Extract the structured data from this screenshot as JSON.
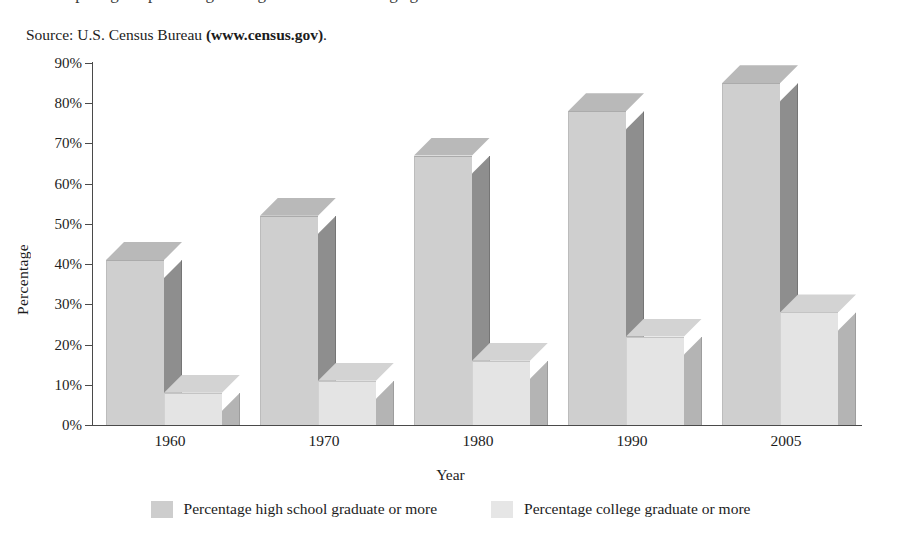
{
  "figure": {
    "headline_clipped": "comparing the percentage of high school and college graduates",
    "source_prefix": "Source: U.S. Census Bureau ",
    "source_site": "(www.census.gov)",
    "source_suffix": "."
  },
  "chart_data": {
    "type": "bar",
    "title": "",
    "xlabel": "Year",
    "ylabel": "Percentage",
    "categories": [
      "1960",
      "1970",
      "1980",
      "1990",
      "2005"
    ],
    "ytick_labels": [
      "0%",
      "10%",
      "20%",
      "30%",
      "40%",
      "50%",
      "60%",
      "70%",
      "80%",
      "90%"
    ],
    "ytick_values": [
      0,
      10,
      20,
      30,
      40,
      50,
      60,
      70,
      80,
      90
    ],
    "ylim": [
      0,
      90
    ],
    "grid": false,
    "legend_position": "bottom",
    "series": [
      {
        "name": "Percentage high school graduate or more",
        "color": "#cdcdcd",
        "values": [
          41,
          52,
          67,
          78,
          85
        ]
      },
      {
        "name": "Percentage college graduate or more",
        "color": "#e6e6e6",
        "values": [
          8,
          11,
          16,
          22,
          28
        ]
      }
    ]
  }
}
